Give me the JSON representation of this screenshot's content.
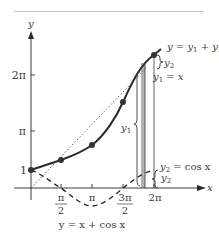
{
  "diagram": {
    "title": "y = x + cos x",
    "axes": {
      "x_label": "x",
      "y_label": "y",
      "x_ticks": [
        "π/2",
        "π",
        "3π/2",
        "2π"
      ],
      "x_tick_parts": [
        {
          "num": "π",
          "den": "2"
        },
        {
          "text": "π"
        },
        {
          "num": "3π",
          "den": "2"
        },
        {
          "text": "2π"
        }
      ],
      "y_ticks": [
        "1",
        "π",
        "2π"
      ]
    },
    "curves": [
      {
        "name": "sum",
        "label": "y = y₁ + y₂",
        "style": "solid-thick"
      },
      {
        "name": "line",
        "label": "y₁ = x",
        "style": "dotted"
      },
      {
        "name": "cosine",
        "label": "y₂ = cos x",
        "style": "dashed"
      }
    ],
    "labels": {
      "sum_curve": "y = y",
      "sum_curve_sub1": "1",
      "sum_curve_plus": " + y",
      "sum_curve_sub2": "2",
      "line_label_y": "y",
      "line_label_sub": "1",
      "line_label_eq": " = x",
      "cos_label_y": "y",
      "cos_label_sub": "2",
      "cos_label_eq": " = cos x",
      "brace_y1": "y",
      "brace_y1_sub": "1",
      "brace_y2_top": "y",
      "brace_y2_top_sub": "2",
      "brace_y2_bottom": "y",
      "brace_y2_bottom_sub": "2"
    },
    "marked_points": [
      {
        "x": "0",
        "y": "1"
      },
      {
        "x": "π/2",
        "y": "π/2"
      },
      {
        "x": "π",
        "y": "π-1"
      },
      {
        "x": "3π/2",
        "y": "3π/2"
      },
      {
        "x": "2π",
        "y": "2π+1"
      }
    ],
    "caption": "y = x + cos x"
  }
}
